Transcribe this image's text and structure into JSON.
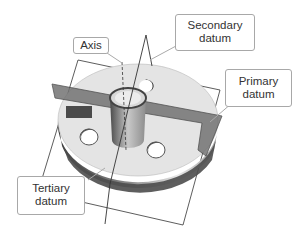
{
  "figure": {
    "labels": {
      "axis": {
        "lines": [
          "Axis"
        ]
      },
      "secondary": {
        "lines": [
          "Secondary",
          "datum"
        ]
      },
      "primary": {
        "lines": [
          "Primary",
          "datum"
        ]
      },
      "tertiary": {
        "lines": [
          "Tertiary",
          "datum"
        ]
      }
    },
    "colors": {
      "part_light": "#e4e4e4",
      "part_mid": "#bdbdbd",
      "part_dark": "#5a5a5a",
      "plane_fill": "#6f6f6f",
      "plane_edge": "#333333",
      "callout_border": "#a8a8a8",
      "text": "#333333"
    }
  }
}
